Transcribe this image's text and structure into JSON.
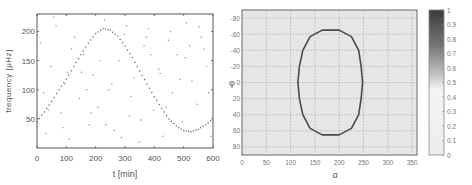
{
  "chart_data": [
    {
      "type": "scatter",
      "title": "",
      "xlabel": "t [min]",
      "ylabel": "frequency [μHz]",
      "xlim": [
        0,
        600
      ],
      "ylim": [
        0,
        230
      ],
      "xticks": [
        0,
        100,
        200,
        300,
        400,
        500,
        600
      ],
      "yticks": [
        50,
        100,
        150,
        200
      ],
      "grid": false,
      "legend": null,
      "series": [
        {
          "name": "sinusoidal track",
          "description": "frequency track following a sine wave: starts ~45 at t=0, peaks ~205 near t=220, minimum ~28 near t=520, returns to ~50 at t=600",
          "x": [
            0,
            25,
            50,
            75,
            100,
            125,
            150,
            175,
            200,
            225,
            250,
            275,
            300,
            325,
            350,
            375,
            400,
            425,
            450,
            475,
            500,
            525,
            550,
            575,
            600
          ],
          "y": [
            45,
            62,
            80,
            100,
            118,
            140,
            160,
            180,
            196,
            205,
            202,
            192,
            175,
            155,
            132,
            110,
            88,
            68,
            50,
            38,
            30,
            28,
            32,
            40,
            50
          ]
        },
        {
          "name": "background noise",
          "description": "randomly scattered points uniformly spread over the whole plot area",
          "x": [
            12,
            30,
            48,
            65,
            82,
            95,
            110,
            128,
            145,
            160,
            178,
            190,
            208,
            230,
            245,
            262,
            280,
            298,
            315,
            330,
            348,
            365,
            380,
            398,
            415,
            430,
            448,
            462,
            478,
            495,
            510,
            528,
            545,
            560,
            578,
            592,
            22,
            58,
            88,
            118,
            152,
            185,
            215,
            255,
            288,
            320,
            355,
            388,
            420,
            455,
            488,
            520,
            552,
            585,
            40,
            105,
            170,
            235,
            305,
            372,
            440,
            505,
            570
          ],
          "y": [
            180,
            25,
            140,
            210,
            60,
            110,
            15,
            190,
            85,
            160,
            40,
            125,
            70,
            220,
            100,
            30,
            150,
            195,
            55,
            120,
            10,
            175,
            205,
            65,
            135,
            20,
            185,
            95,
            160,
            45,
            215,
            115,
            75,
            190,
            140,
            20,
            95,
            225,
            35,
            170,
            130,
            60,
            150,
            110,
            18,
            88,
            48,
            160,
            128,
            200,
            118,
            175,
            208,
            95,
            65,
            130,
            100,
            40,
            210,
            190,
            70,
            155,
            170
          ]
        }
      ]
    },
    {
      "type": "heatmap",
      "title": "",
      "xlabel": "α",
      "ylabel": "φ",
      "xlim": [
        0,
        360
      ],
      "ylim": [
        90,
        -90
      ],
      "xticks": [
        0,
        50,
        100,
        150,
        200,
        250,
        300,
        350
      ],
      "yticks": [
        -80,
        -60,
        -40,
        -20,
        0,
        20,
        40,
        60,
        80
      ],
      "grid": true,
      "description": "uniform near-zero background with a closed rounded-rectangle (stadium) contour of higher value",
      "contour": {
        "shape": "stadium",
        "alpha_range": [
          115,
          250
        ],
        "phi_range": [
          -65,
          65
        ],
        "points": [
          [
            165,
            -65
          ],
          [
            200,
            -65
          ],
          [
            225,
            -57
          ],
          [
            240,
            -40
          ],
          [
            245,
            -20
          ],
          [
            248,
            0
          ],
          [
            245,
            20
          ],
          [
            240,
            40
          ],
          [
            225,
            57
          ],
          [
            200,
            65
          ],
          [
            165,
            65
          ],
          [
            140,
            57
          ],
          [
            125,
            40
          ],
          [
            118,
            20
          ],
          [
            115,
            0
          ],
          [
            118,
            -20
          ],
          [
            125,
            -40
          ],
          [
            140,
            -57
          ],
          [
            165,
            -65
          ]
        ]
      },
      "colorbar": {
        "min": 0,
        "max": 1,
        "ticks": [
          0,
          0.1,
          0.2,
          0.3,
          0.4,
          0.5,
          0.6,
          0.7,
          0.8,
          0.9,
          1
        ],
        "tick_labels": [
          "0",
          "0.1",
          "0.2",
          "0.3",
          "0.4",
          "0.5",
          "0.6",
          "0.7",
          "0.8",
          "0.9",
          "1"
        ],
        "colormap": "gray (reversed: white=0, dark=1)"
      }
    }
  ],
  "colors": {
    "axis": "#555555",
    "scatter_point": "#8a8a8a",
    "track_point": "#6a6a6a",
    "heatmap_bg": "#e6e6e6",
    "grid": "#9a9a9a",
    "contour": "#4a4a4a",
    "colorbar_top": "#3c3c3c",
    "colorbar_bottom": "#ececec"
  }
}
